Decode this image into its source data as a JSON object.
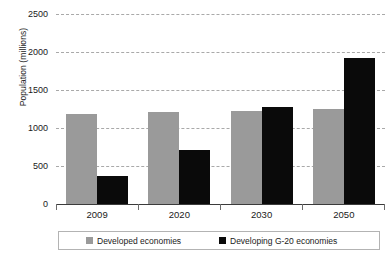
{
  "chart_data": {
    "type": "bar",
    "title": "",
    "subtitle": "",
    "xlabel": "",
    "ylabel": "Population (millions)",
    "categories": [
      "2009",
      "2020",
      "2030",
      "2050"
    ],
    "series": [
      {
        "name": "Developed economies",
        "color": "#9a9a9a",
        "values": [
          1190,
          1215,
          1230,
          1245
        ]
      },
      {
        "name": "Developing G-20 economies",
        "color": "#0a0a0a",
        "values": [
          370,
          715,
          1270,
          1920
        ]
      }
    ],
    "ylim": [
      0,
      2500
    ],
    "yticks": [
      0,
      500,
      1000,
      1500,
      2000,
      2500
    ],
    "ytick_labels": [
      "0",
      "500",
      "1000",
      "1500",
      "2000",
      "2500"
    ],
    "grid": true,
    "grid_style": "dashed-horizontal",
    "legend_position": "bottom",
    "legend": [
      "Developed economies",
      "Developing G-20 economies"
    ]
  },
  "axes": {
    "y_title": "Population (millions)"
  },
  "legend": {
    "items": [
      {
        "label": "Developed economies",
        "color": "#9a9a9a"
      },
      {
        "label": "Developing G-20 economies",
        "color": "#0a0a0a"
      }
    ]
  }
}
